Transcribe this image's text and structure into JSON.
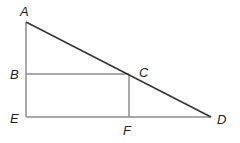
{
  "diagram": {
    "type": "geometry",
    "colors": {
      "background": "#ffffff",
      "hypotenuse": "#333333",
      "sides": "#8c8c8c",
      "label": "#222222"
    },
    "points": {
      "A": {
        "label": "A",
        "x": 26,
        "y": 22
      },
      "B": {
        "label": "B",
        "x": 26,
        "y": 74
      },
      "C": {
        "label": "C",
        "x": 129,
        "y": 74
      },
      "D": {
        "label": "D",
        "x": 211,
        "y": 117
      },
      "E": {
        "label": "E",
        "x": 26,
        "y": 117
      },
      "F": {
        "label": "F",
        "x": 129,
        "y": 117
      }
    },
    "segments": [
      {
        "from": "A",
        "to": "E",
        "name": "AE"
      },
      {
        "from": "E",
        "to": "D",
        "name": "ED"
      },
      {
        "from": "A",
        "to": "D",
        "name": "AD"
      },
      {
        "from": "B",
        "to": "C",
        "name": "BC"
      },
      {
        "from": "C",
        "to": "F",
        "name": "CF"
      }
    ]
  }
}
